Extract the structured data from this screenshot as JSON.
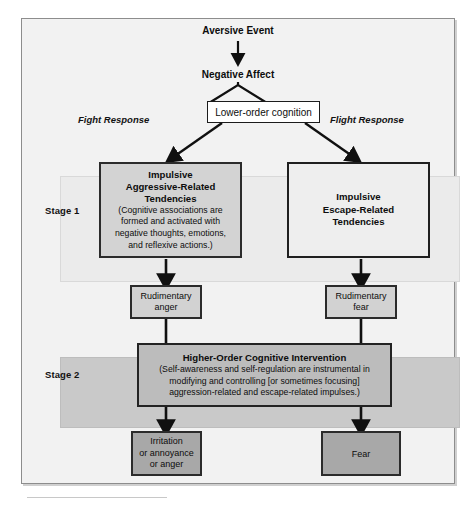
{
  "figure": {
    "title_top": "Aversive Event",
    "title_second": "Negative Affect",
    "branch_left_label": "Fight Response",
    "branch_right_label": "Flight Response",
    "gate_box": "Lower-order cognition",
    "bands": [
      {
        "label": "Stage 1",
        "fill": "#ebebeb"
      },
      {
        "label": "Stage 2",
        "fill": "#c9c9c9"
      }
    ],
    "stage1": {
      "left_box": {
        "title_lines": [
          "Impulsive",
          "Aggressive-Related",
          "Tendencies"
        ],
        "body_lines": [
          "(Cognitive associations are",
          "formed and activated with",
          "negative thoughts, emotions,",
          "and reflexive actions.)"
        ],
        "fill": "#d3d3d3"
      },
      "right_box": {
        "title_lines": [
          "Impulsive",
          "Escape-Related",
          "Tendencies"
        ],
        "body_lines": [],
        "fill": "#eeeeee"
      }
    },
    "intermediate": {
      "left_box": {
        "lines": [
          "Rudimentary",
          "anger"
        ],
        "fill": "#d2d2d2"
      },
      "right_box": {
        "lines": [
          "Rudimentary",
          "fear"
        ],
        "fill": "#d2d2d2"
      }
    },
    "stage2": {
      "box": {
        "title_lines": [
          "Higher-Order Cognitive Intervention"
        ],
        "body_lines": [
          "(Self-awareness and self-regulation are instrumental in",
          "modifying and controlling [or sometimes focusing]",
          "aggression-related and escape-related impulses.)"
        ],
        "fill": "#bcbcbc"
      }
    },
    "outcomes": {
      "left_box": {
        "lines": [
          "Irritation",
          "or annoyance",
          "or anger"
        ],
        "fill": "#a8a8a8"
      },
      "right_box": {
        "lines": [
          "Fear"
        ],
        "fill": "#a8a8a8"
      }
    },
    "colors": {
      "frame_fill": "#f2f2f2",
      "frame_border": "#8d8d8d",
      "ink": "#0d0d0d"
    }
  }
}
